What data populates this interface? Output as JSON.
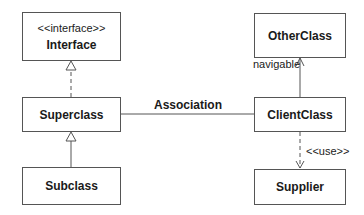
{
  "classes": {
    "interface": {
      "stereotype": "<<interface>>",
      "name": "Interface"
    },
    "superclass": {
      "name": "Superclass"
    },
    "subclass": {
      "name": "Subclass"
    },
    "otherclass": {
      "name": "OtherClass"
    },
    "clientclass": {
      "name": "ClientClass"
    },
    "supplier": {
      "name": "Supplier"
    }
  },
  "relations": {
    "association": {
      "label": "Association"
    },
    "navigable": {
      "label": "navigable"
    },
    "use": {
      "label": "<<use>>"
    }
  },
  "colors": {
    "line": "#555555",
    "text": "#1a1a1a",
    "background": "#ffffff"
  }
}
